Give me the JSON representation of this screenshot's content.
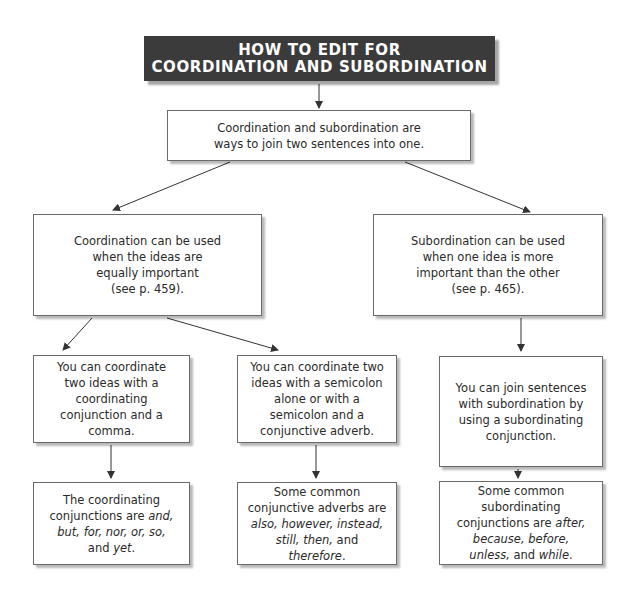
{
  "title": {
    "line1": "HOW TO EDIT FOR",
    "line2": "COORDINATION AND SUBORDINATION"
  },
  "intro": {
    "lines": [
      "Coordination and subordination are",
      "ways to join two sentences into one."
    ]
  },
  "coordination": {
    "lines": [
      "Coordination can be used",
      "when the ideas are",
      "equally important",
      "(see p. 459)."
    ]
  },
  "subordination": {
    "lines": [
      "Subordination can be used",
      "when one idea is more",
      "important than the other",
      "(see p. 465)."
    ]
  },
  "coord_conjunction": {
    "lines": [
      "You can coordinate",
      "two ideas with a",
      "coordinating",
      "conjunction and a",
      "comma."
    ]
  },
  "coord_semicolon": {
    "lines": [
      "You can coordinate two",
      "ideas with a semicolon",
      "alone or with a",
      "semicolon and a",
      "conjunctive adverb."
    ]
  },
  "sub_join": {
    "lines": [
      "You can join sentences",
      "with subordination by",
      "using a subordinating",
      "conjunction."
    ]
  },
  "coord_list": {
    "line1": "The coordinating",
    "line2_pre": "conjunctions are ",
    "line2_it": "and,",
    "line3_it": "but, for, nor, or, so,",
    "line4_pre": "and ",
    "line4_it": "yet",
    "line4_post": "."
  },
  "adverb_list": {
    "line1": "Some common",
    "line2": "conjunctive adverbs are",
    "line3_it": "also, however, instead,",
    "line4_it1": "still, then,",
    "line4_post": " and",
    "line5_it": "therefore",
    "line5_post": "."
  },
  "sub_list": {
    "line1": "Some common",
    "line2": "subordinating",
    "line3_pre": "conjunctions are ",
    "line3_it": "after,",
    "line4_it": "because, before,",
    "line5_it": "unless,",
    "line5_mid": " and ",
    "line5_it2": "while",
    "line5_post": "."
  },
  "colors": {
    "title_bg": "#3b3b3b",
    "title_text": "#ffffff",
    "border": "#6a6a6a",
    "arrow": "#333333"
  }
}
